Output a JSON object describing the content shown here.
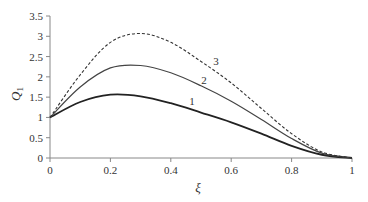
{
  "chart_data": {
    "type": "line",
    "title": "",
    "xlabel": "ξ",
    "ylabel": "Q1",
    "xlim": [
      0,
      1
    ],
    "ylim": [
      0,
      3.5
    ],
    "grid": false,
    "legend": "inline curve labels",
    "x_ticks": [
      "0",
      "0.2",
      "0.4",
      "0.6",
      "0.8",
      "1"
    ],
    "y_ticks": [
      "0",
      "0.5",
      "1",
      "1.5",
      "2",
      "2.5",
      "3",
      "3.5"
    ],
    "x": [
      0,
      0.1,
      0.2,
      0.3,
      0.4,
      0.5,
      0.6,
      0.7,
      0.8,
      0.9,
      1.0
    ],
    "series": [
      {
        "name": "1",
        "style": "solid-thick",
        "values": [
          1,
          1.38,
          1.56,
          1.52,
          1.35,
          1.12,
          0.88,
          0.6,
          0.3,
          0.08,
          0
        ]
      },
      {
        "name": "2",
        "style": "solid",
        "values": [
          1,
          1.75,
          2.22,
          2.28,
          2.1,
          1.78,
          1.4,
          0.95,
          0.48,
          0.12,
          0
        ]
      },
      {
        "name": "3",
        "style": "dashed",
        "values": [
          1,
          2.05,
          2.85,
          3.07,
          2.85,
          2.38,
          1.85,
          1.22,
          0.6,
          0.15,
          0
        ]
      }
    ],
    "annotations": [
      {
        "text": "1",
        "x": 0.47,
        "y": 1.3
      },
      {
        "text": "2",
        "x": 0.51,
        "y": 1.82
      },
      {
        "text": "3",
        "x": 0.55,
        "y": 2.3
      }
    ]
  },
  "labels": {
    "xlabel": "ξ",
    "ylabel_main": "Q",
    "ylabel_sub": "1"
  }
}
